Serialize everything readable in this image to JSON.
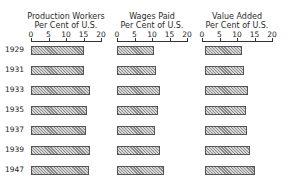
{
  "chart_data": {
    "type": "bar",
    "orientation": "horizontal",
    "categories": [
      "1929",
      "1931",
      "1933",
      "1935",
      "1937",
      "1939",
      "1947"
    ],
    "panels": [
      {
        "title_line1": "Production Workers",
        "title_line2": "Per Cent of U.S.",
        "xlim": [
          0,
          20
        ],
        "ticks": [
          "0",
          "5",
          "10",
          "15",
          "20"
        ],
        "values": [
          15.0,
          15.2,
          16.9,
          16.1,
          15.8,
          16.9,
          16.6
        ]
      },
      {
        "title_line1": "Wages Paid",
        "title_line2": "Per Cent of U.S.",
        "xlim": [
          0,
          20
        ],
        "ticks": [
          "0",
          "5",
          "10",
          "15",
          "20"
        ],
        "values": [
          10.6,
          11.1,
          12.3,
          11.7,
          10.9,
          12.3,
          13.4
        ]
      },
      {
        "title_line1": "Value Added",
        "title_line2": "Per Cent of U.S.",
        "xlim": [
          0,
          20
        ],
        "ticks": [
          "0",
          "5",
          "10",
          "15",
          "20"
        ],
        "values": [
          11.4,
          12.0,
          13.1,
          12.6,
          12.9,
          13.7,
          15.1
        ]
      }
    ],
    "grid": false,
    "legend": null,
    "bar_fill": "hatched gray"
  }
}
